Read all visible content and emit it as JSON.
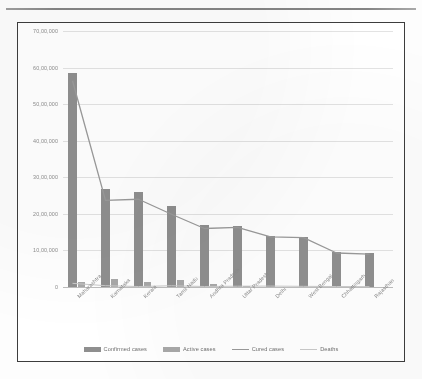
{
  "document": {
    "top_rule": true
  },
  "legend": {
    "position": "bottom",
    "items": [
      {
        "label": "Confirmed cases",
        "marker": "bar",
        "color": "#8f8f8f"
      },
      {
        "label": "Active cases",
        "marker": "bar",
        "color": "#a8a8a8"
      },
      {
        "label": "Cured cases",
        "marker": "line",
        "color": "#9a9a9a"
      },
      {
        "label": "Deaths",
        "marker": "line",
        "color": "#c9c9c9"
      }
    ]
  },
  "axis": {
    "y_ticks": [
      "0",
      "10,00,000",
      "20,00,000",
      "30,00,000",
      "40,00,000",
      "50,00,000",
      "60,00,000",
      "70,00,000"
    ]
  },
  "chart_data": {
    "type": "bar",
    "title": "",
    "subtitle": "",
    "xlabel": "",
    "ylabel": "",
    "ylim": [
      0,
      7000000
    ],
    "ytick_values": [
      0,
      1000000,
      2000000,
      3000000,
      4000000,
      5000000,
      6000000,
      7000000
    ],
    "ytick_labels": [
      "0",
      "10,00,000",
      "20,00,000",
      "30,00,000",
      "40,00,000",
      "50,00,000",
      "60,00,000",
      "70,00,000"
    ],
    "grid": true,
    "legend_position": "bottom",
    "categories": [
      "Maharashtra",
      "Karnataka",
      "Kerala",
      "Tamil Nadu",
      "Andhra Pradesh",
      "Uttar Pradesh",
      "Delhi",
      "West Bengal",
      "Chhattisgarh",
      "Rajasthan"
    ],
    "series": [
      {
        "name": "Confirmed cases",
        "type": "bar",
        "color": "#8f8f8f",
        "values": [
          5860000,
          2670000,
          2610000,
          2220000,
          1690000,
          1660000,
          1400000,
          1380000,
          950000,
          920000
        ]
      },
      {
        "name": "Active cases",
        "type": "bar",
        "color": "#a8a8a8",
        "values": [
          140000,
          210000,
          140000,
          190000,
          80000,
          20000,
          10000,
          10000,
          10000,
          10000
        ]
      },
      {
        "name": "Cured cases",
        "type": "line",
        "color": "#9a9a9a",
        "values": [
          5640000,
          2370000,
          2400000,
          1990000,
          1600000,
          1630000,
          1370000,
          1350000,
          930000,
          900000
        ]
      },
      {
        "name": "Deaths",
        "type": "line",
        "color": "#c9c9c9",
        "values": [
          100000,
          36000,
          13000,
          34000,
          14000,
          22000,
          25000,
          18000,
          13000,
          9000
        ]
      }
    ]
  }
}
